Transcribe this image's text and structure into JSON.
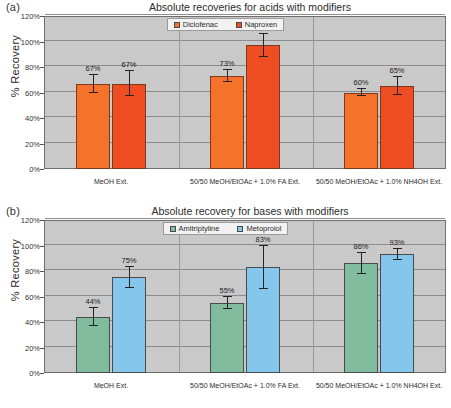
{
  "figure": {
    "panels": [
      {
        "tag": "(a)",
        "title": "Absolute recoveries for acids with modifiers"
      },
      {
        "tag": "(b)",
        "title": "Absolute recovery for bases with modifiers"
      }
    ]
  },
  "colors": {
    "plot_background": "#c9c9c9",
    "gridline": "#8d8d8d",
    "axis": "#6e6e6e",
    "diclofenac": "#F4722A",
    "naproxen": "#EE4E22",
    "amitriptyline": "#82BC9E",
    "metoprolol": "#84C6EC",
    "error_bar": "#232323",
    "legend_background": "#f2f2f2"
  },
  "chart_data": [
    {
      "type": "bar",
      "panel": "(a)",
      "title": "Absolute recoveries for acids with modifiers",
      "xlabel": "",
      "ylabel": "% Recovery",
      "ylim": [
        0,
        120
      ],
      "yticks": [
        "0%",
        "20%",
        "40%",
        "60%",
        "80%",
        "100%",
        "120%"
      ],
      "ytick_values": [
        0,
        20,
        40,
        60,
        80,
        100,
        120
      ],
      "grid": true,
      "legend_position": "top-center",
      "categories": [
        "MeOH Ext.",
        "50/50 MeOH/EtOAc + 1.0% FA Ext.",
        "50/50 MeOH/EtOAc + 1.0% NH4OH Ext."
      ],
      "series": [
        {
          "name": "Diclofenac",
          "color": "#F4722A",
          "values": [
            67,
            73,
            60
          ],
          "labels": [
            "67%",
            "73%",
            "60%"
          ],
          "errors": [
            7,
            5,
            3
          ]
        },
        {
          "name": "Naproxen",
          "color": "#EE4E22",
          "values": [
            67,
            97,
            65
          ],
          "labels": [
            "67%",
            "97%",
            "65%"
          ],
          "errors": [
            10,
            9,
            7
          ]
        }
      ]
    },
    {
      "type": "bar",
      "panel": "(b)",
      "title": "Absolute recovery for bases with modifiers",
      "xlabel": "",
      "ylabel": "% Recovery",
      "ylim": [
        0,
        120
      ],
      "yticks": [
        "0%",
        "20%",
        "40%",
        "60%",
        "80%",
        "100%",
        "120%"
      ],
      "ytick_values": [
        0,
        20,
        40,
        60,
        80,
        100,
        120
      ],
      "grid": true,
      "legend_position": "top-center",
      "categories": [
        "MeOH Ext.",
        "50/50 MeOH/EtOAc + 1.0% FA Ext.",
        "50/50 MeOH/EtOAc + 1.0% NH4OH Ext."
      ],
      "series": [
        {
          "name": "Amitriptyline",
          "color": "#82BC9E",
          "values": [
            44,
            55,
            86
          ],
          "labels": [
            "44%",
            "55%",
            "86%"
          ],
          "errors": [
            7,
            5,
            8
          ]
        },
        {
          "name": "Metoprolol",
          "color": "#84C6EC",
          "values": [
            75,
            83,
            93
          ],
          "labels": [
            "75%",
            "83%",
            "93%"
          ],
          "errors": [
            8,
            17,
            4
          ]
        }
      ]
    }
  ]
}
